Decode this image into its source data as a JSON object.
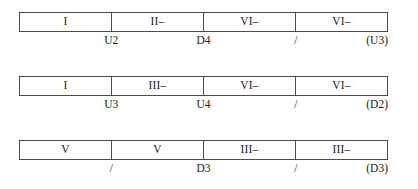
{
  "diagram": {
    "type": "segmented-bar-sequence",
    "segment_count_per_row": 4,
    "rows": [
      {
        "id": "row-1",
        "segments": [
          "I",
          "II–",
          "VI–",
          "VI–"
        ],
        "marks": [
          "U2",
          "D4",
          "/",
          "(U3)"
        ]
      },
      {
        "id": "row-2",
        "segments": [
          "I",
          "III–",
          "VI–",
          "VI–"
        ],
        "marks": [
          "U3",
          "U4",
          "/",
          "(D2)"
        ]
      },
      {
        "id": "row-3",
        "segments": [
          "V",
          "V",
          "III–",
          "III–"
        ],
        "marks": [
          "/",
          "D3",
          "/",
          "(D3)"
        ]
      }
    ]
  },
  "colors": {
    "background": "#ffffff",
    "border": "#4d4d4d",
    "text": "#1a1a1a"
  }
}
